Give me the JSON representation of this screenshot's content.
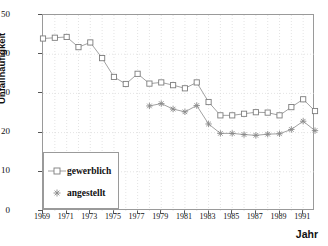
{
  "chart_data": {
    "type": "line",
    "title": "",
    "xlabel": "Jahr",
    "ylabel": "Unfallhäufigkeit",
    "xlim": [
      1969,
      1992
    ],
    "ylim": [
      0,
      50
    ],
    "grid": true,
    "legend_position": "bottom-left",
    "x_ticks": [
      "1969",
      "1971",
      "1973",
      "1975",
      "1977",
      "1979",
      "1981",
      "1983",
      "1985",
      "1987",
      "1989",
      "1991"
    ],
    "x_tick_values": [
      1969,
      1971,
      1973,
      1975,
      1977,
      1979,
      1981,
      1983,
      1985,
      1987,
      1989,
      1991
    ],
    "y_ticks": [
      "0",
      "10",
      "20",
      "30",
      "40",
      "50"
    ],
    "y_tick_values": [
      0,
      10,
      20,
      30,
      40,
      50
    ],
    "series": [
      {
        "name": "gewerblich",
        "marker": "open-square",
        "color": "#8a8a8a",
        "x": [
          1969,
          1970,
          1971,
          1972,
          1973,
          1974,
          1975,
          1976,
          1977,
          1978,
          1979,
          1980,
          1981,
          1982,
          1983,
          1984,
          1985,
          1986,
          1987,
          1988,
          1989,
          1990,
          1991,
          1992
        ],
        "values": [
          44.0,
          44.2,
          44.4,
          41.8,
          43.0,
          39.0,
          34.2,
          32.4,
          35.0,
          32.5,
          32.8,
          32.1,
          31.3,
          32.8,
          27.8,
          24.4,
          24.4,
          24.8,
          25.2,
          25.1,
          24.4,
          26.5,
          28.5,
          25.5
        ]
      },
      {
        "name": "angestellt",
        "marker": "asterisk",
        "color": "#8a8a8a",
        "x": [
          1978,
          1979,
          1980,
          1981,
          1982,
          1983,
          1984,
          1985,
          1986,
          1987,
          1988,
          1989,
          1990,
          1991,
          1992
        ],
        "values": [
          26.8,
          27.4,
          26.0,
          25.3,
          26.9,
          22.2,
          19.8,
          19.8,
          19.5,
          19.3,
          19.6,
          19.7,
          20.8,
          22.9,
          20.5
        ]
      }
    ]
  },
  "legend": {
    "items": [
      {
        "label": "gewerblich"
      },
      {
        "label": "angestellt"
      }
    ]
  },
  "colors": {
    "line": "#8a8a8a",
    "frame": "#9a9a9a",
    "grid": "#d8d8d8",
    "text": "#111111"
  }
}
